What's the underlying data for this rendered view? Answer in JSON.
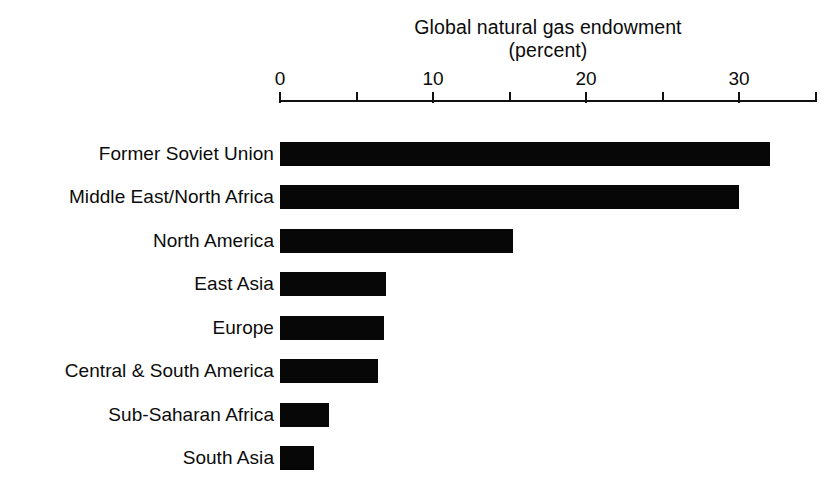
{
  "chart_data": {
    "type": "bar",
    "orientation": "horizontal",
    "title": "Global natural gas endowment",
    "subtitle": "(percent)",
    "xlabel": "",
    "ylabel": "",
    "xlim": [
      0,
      35
    ],
    "grid": false,
    "legend": false,
    "bar_color": "#070707",
    "background_color": "#ffffff",
    "axis_color": "#111111",
    "tick_values": [
      0,
      5,
      10,
      15,
      20,
      25,
      30,
      35
    ],
    "tick_labels_shown": [
      "0",
      "",
      "10",
      "",
      "20",
      "",
      "30",
      ""
    ],
    "categories": [
      "Former Soviet Union",
      "Middle East/North Africa",
      "North America",
      "East Asia",
      "Europe",
      "Central & South America",
      "Sub-Saharan Africa",
      "South Asia"
    ],
    "values": [
      32.0,
      30.0,
      15.2,
      6.9,
      6.8,
      6.4,
      3.2,
      2.2
    ]
  }
}
